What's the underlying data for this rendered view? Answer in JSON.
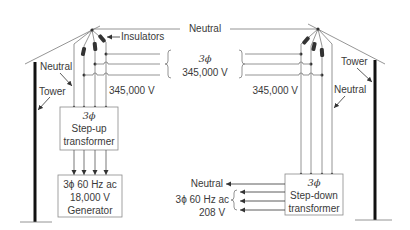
{
  "diagram": {
    "labels": {
      "neutral_top": "Neutral",
      "insulators": "Insulators",
      "line_phase": "3ϕ",
      "line_voltage": "345,000 V",
      "left_voltage": "345,000 V",
      "right_voltage": "345,000 V",
      "left_neutral": "Neutral",
      "left_tower": "Tower",
      "right_neutral": "Neutral",
      "right_tower": "Tower"
    },
    "step_up_transformer": {
      "line1": "3ϕ",
      "line2": "Step-up",
      "line3": "transformer"
    },
    "generator": {
      "line1": "3ϕ 60 Hz ac",
      "line2": "18,000 V",
      "line3": "Generator"
    },
    "step_down_transformer": {
      "line1": "3ϕ",
      "line2": "Step-down",
      "line3": "transformer"
    },
    "output": {
      "neutral": "Neutral",
      "phase": "3ϕ 60 Hz ac",
      "voltage": "208 V"
    },
    "colors": {
      "line": "#7a7a7a",
      "tower": "#111111",
      "text": "#3a3a3a",
      "box_border": "#8a8a8a"
    }
  }
}
